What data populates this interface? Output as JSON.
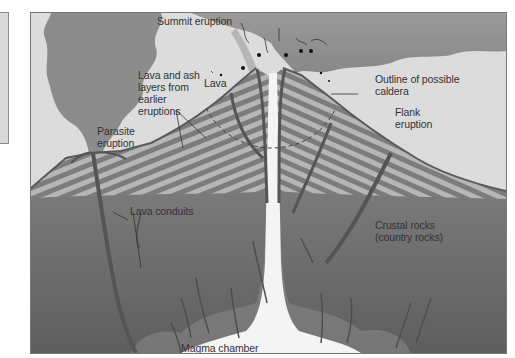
{
  "diagram": {
    "labels": {
      "summit_eruption": "Summit eruption",
      "lava_ash_layers": "Lava and ash\nlayers from\nearlier\neruptions",
      "lava": "Lava",
      "outline_caldera": "Outline of possible\ncaldera",
      "parasite_eruption": "Parasite\neruption",
      "flank_eruption": "Flank\neruption",
      "lava_conduits": "Lava conduits",
      "crustal_rocks": "Crustal rocks\n(country rocks)",
      "magma_chamber": "Magma chamber"
    },
    "colors": {
      "sky": "#dcdcdc",
      "ash_cloud": "#8f8f8f",
      "cone_light": "#b4b4b4",
      "cone_dark": "#7a7a7a",
      "crust": "#6e6e6e",
      "conduit": "#555555",
      "magma": "#f4f4f4"
    }
  }
}
